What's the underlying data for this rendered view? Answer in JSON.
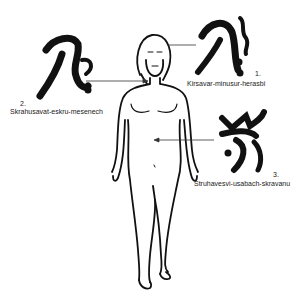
{
  "labels": [
    {
      "number": "1.",
      "text": "Kirsavar-minusur-herasbi",
      "target": "head"
    },
    {
      "number": "2.",
      "text": "Skrahusavat-eskru-mesenech",
      "target": "chest"
    },
    {
      "number": "3.",
      "text": "Struhavesvi-usabach-skravanu",
      "target": "abdomen"
    }
  ],
  "icons": [
    "rune-symbol-1",
    "rune-symbol-2",
    "rune-symbol-3"
  ],
  "colors": {
    "ink": "#111111",
    "background": "#ffffff"
  }
}
